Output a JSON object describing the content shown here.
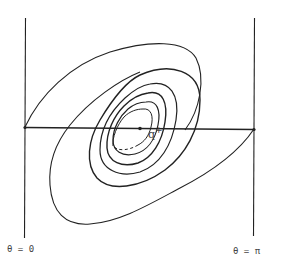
{
  "diagram": {
    "type": "phase-portrait-contours",
    "labels": {
      "left_boundary": "θ = 0",
      "right_boundary": "θ = π",
      "fixed_point": "q",
      "fixed_point_sup": "+"
    },
    "colors": {
      "stroke": "#222222",
      "background": "#ffffff",
      "label": "#444444"
    }
  }
}
